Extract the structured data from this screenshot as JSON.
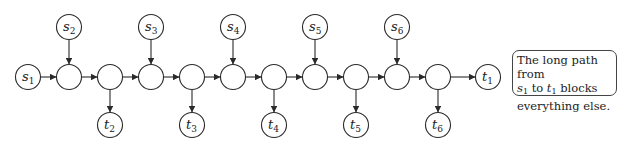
{
  "diagram": {
    "type": "directed-graph",
    "chain_nodes": [
      {
        "id": "c1",
        "x": 69
      },
      {
        "id": "c2",
        "x": 110
      },
      {
        "id": "c3",
        "x": 151
      },
      {
        "id": "c4",
        "x": 192
      },
      {
        "id": "c5",
        "x": 233
      },
      {
        "id": "c6",
        "x": 274
      },
      {
        "id": "c7",
        "x": 315
      },
      {
        "id": "c8",
        "x": 356
      },
      {
        "id": "c9",
        "x": 397
      },
      {
        "id": "c10",
        "x": 438
      }
    ],
    "sources": [
      {
        "label": "s",
        "sub": "1",
        "to": "c1",
        "x": 28,
        "y": 77
      },
      {
        "label": "s",
        "sub": "2",
        "to": "c1",
        "x": 69,
        "y": 27
      },
      {
        "label": "s",
        "sub": "3",
        "to": "c3",
        "x": 151,
        "y": 27
      },
      {
        "label": "s",
        "sub": "4",
        "to": "c5",
        "x": 233,
        "y": 27
      },
      {
        "label": "s",
        "sub": "5",
        "to": "c7",
        "x": 315,
        "y": 27
      },
      {
        "label": "s",
        "sub": "6",
        "to": "c9",
        "x": 397,
        "y": 27
      }
    ],
    "sinks": [
      {
        "label": "t",
        "sub": "1",
        "from": "c10",
        "x": 488,
        "y": 77
      },
      {
        "label": "t",
        "sub": "2",
        "from": "c2",
        "x": 110,
        "y": 125
      },
      {
        "label": "t",
        "sub": "3",
        "from": "c4",
        "x": 192,
        "y": 125
      },
      {
        "label": "t",
        "sub": "4",
        "from": "c6",
        "x": 274,
        "y": 125
      },
      {
        "label": "t",
        "sub": "5",
        "from": "c8",
        "x": 356,
        "y": 125
      },
      {
        "label": "t",
        "sub": "6",
        "from": "c10",
        "x": 438,
        "y": 125
      }
    ],
    "annotation": {
      "line1": "The long path from",
      "line2_var1": "s",
      "line2_sub1": "1",
      "line2_mid": " to ",
      "line2_var2": "t",
      "line2_sub2": "1",
      "line2_end": " blocks",
      "line3": "everything else."
    }
  }
}
